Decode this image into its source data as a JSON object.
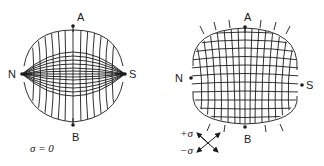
{
  "figure": {
    "colors": {
      "ink": "#1a1a1a",
      "background": "#ffffff"
    },
    "panels": [
      {
        "id": "left",
        "description": "grid deformed with poles N and S, zero stress",
        "labels": {
          "top": "A",
          "bottom": "B",
          "left": "N",
          "right": "S"
        },
        "caption": "σ = 0"
      },
      {
        "id": "right",
        "description": "grid deformed under stress with poles N and S",
        "labels": {
          "top": "A",
          "bottom": "B",
          "left": "N",
          "right": "S"
        },
        "legend": {
          "positive": "+σ",
          "negative": "−σ",
          "icon": "crossed-arrows-icon"
        }
      }
    ]
  }
}
